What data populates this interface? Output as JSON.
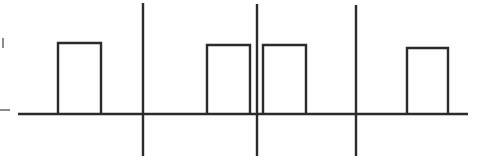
{
  "figure": {
    "background_color": "#fefefe",
    "ink_color": "#2b2b2b",
    "tick_color": "#6e6e6e",
    "width": 485,
    "height": 164
  },
  "chart_data": {
    "type": "line",
    "xlabel": "",
    "ylabel": "",
    "xlim": [
      0,
      485
    ],
    "ylim": [
      164,
      0
    ],
    "grid": false,
    "legend": null,
    "baseline": {
      "label": "baseline",
      "y": 114,
      "x_start": 18,
      "x_end": 468
    },
    "pulses": [
      {
        "index": 1,
        "label": "pulse-1",
        "x_start": 58,
        "x_end": 101,
        "y_top": 43,
        "y_base": 114,
        "width": 43,
        "height": 71
      },
      {
        "index": 2,
        "label": "pulse-2",
        "x_start": 207,
        "x_end": 250,
        "y_top": 45,
        "y_base": 114,
        "width": 43,
        "height": 69
      },
      {
        "index": 3,
        "label": "pulse-3",
        "x_start": 263,
        "x_end": 306,
        "y_top": 45,
        "y_base": 114,
        "width": 43,
        "height": 69
      },
      {
        "index": 4,
        "label": "pulse-4",
        "x_start": 407,
        "x_end": 448,
        "y_top": 48,
        "y_base": 114,
        "width": 41,
        "height": 66
      }
    ],
    "dividers": [
      {
        "index": 1,
        "label": "divider-1",
        "x": 143,
        "y_top": 3,
        "y_bottom": 156
      },
      {
        "index": 2,
        "label": "divider-2",
        "x": 257,
        "y_top": 4,
        "y_bottom": 156
      },
      {
        "index": 3,
        "label": "divider-3",
        "x": 356,
        "y_top": 5,
        "y_bottom": 156
      }
    ],
    "axis_ticks": [
      {
        "index": 1,
        "label": "tick-upper",
        "orientation": "vertical",
        "x": 3,
        "y_top": 38,
        "y_bottom": 48
      },
      {
        "index": 2,
        "label": "tick-baseline",
        "orientation": "horizontal",
        "y": 110,
        "x_start": 0,
        "x_end": 10
      }
    ]
  }
}
